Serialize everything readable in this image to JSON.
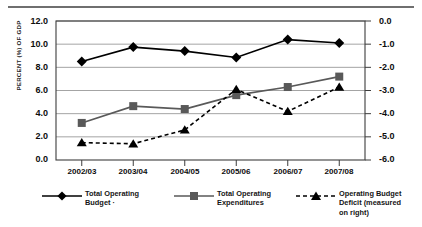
{
  "chart_data": {
    "type": "line",
    "title": "",
    "subtitle": "",
    "xlabel": "",
    "ylabel": "PERCENT (%) OF GDP",
    "ylabel_right": "",
    "categories": [
      "2002/03",
      "2003/04",
      "2004/05",
      "2005/06",
      "2006/07",
      "2007/08"
    ],
    "ylim": [
      0.0,
      12.0
    ],
    "yticks": [
      "0.0",
      "2.0",
      "4.0",
      "6.0",
      "8.0",
      "10.0",
      "12.0"
    ],
    "ylim_right": [
      -6.0,
      0.0
    ],
    "yticks_right": [
      "0.0",
      "-1.0",
      "-2.0",
      "-3.0",
      "-4.0",
      "-5.0",
      "-6.0"
    ],
    "grid": true,
    "legend_position": "bottom",
    "series": [
      {
        "name": "Total Operating Budget ·",
        "axis": "left",
        "marker": "diamond",
        "linestyle": "solid",
        "color": "#000000",
        "values": [
          8.5,
          9.75,
          9.4,
          8.85,
          10.4,
          10.1
        ]
      },
      {
        "name": "Total Operating Expenditures",
        "axis": "left",
        "marker": "square",
        "linestyle": "solid",
        "color": "#595959",
        "values": [
          3.2,
          4.65,
          4.4,
          5.6,
          6.3,
          7.2
        ]
      },
      {
        "name": "Operating Budget Deficit (measured on right)",
        "axis": "right",
        "marker": "triangle",
        "linestyle": "dashed",
        "color": "#000000",
        "values": [
          -5.25,
          -5.3,
          -4.7,
          -2.95,
          -3.9,
          -2.85
        ]
      }
    ]
  },
  "legend": {
    "items": [
      {
        "label": "Total Operating\nBudget ·",
        "marker": "diamond",
        "linestyle": "solid"
      },
      {
        "label": "Total Operating\nExpenditures",
        "marker": "square",
        "linestyle": "solid"
      },
      {
        "label": "Operating Budget\nDeficit (measured\non right)",
        "marker": "triangle",
        "linestyle": "dashed"
      }
    ]
  },
  "colors": {
    "series_primary": "#000000",
    "series_secondary": "#595959",
    "series_tertiary": "#000000",
    "grid": "#9a9a9a",
    "axis": "#3d3d3d",
    "rule": "#6f6f6f"
  }
}
